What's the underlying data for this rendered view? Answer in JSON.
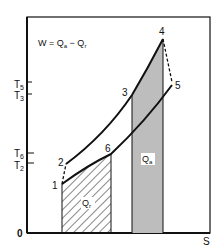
{
  "diagram": {
    "type": "T-S diagram (Brayton cycle with regeneration)",
    "equation": {
      "prefix": "W = Q",
      "sub_a": "a",
      "minus": " − Q",
      "sub_r": "r"
    },
    "axes": {
      "origin_label": "0",
      "x_label": "S",
      "y_ticks": [
        {
          "main": "T",
          "sub": "5"
        },
        {
          "main": "T",
          "sub": "3"
        },
        {
          "main": "T",
          "sub": "6"
        },
        {
          "main": "T",
          "sub": "2"
        }
      ]
    },
    "points": [
      {
        "label": "1"
      },
      {
        "label": "2"
      },
      {
        "label": "3"
      },
      {
        "label": "4"
      },
      {
        "label": "5"
      },
      {
        "label": "6"
      }
    ],
    "regions": {
      "heat_added": {
        "main": "Q",
        "sub": "a",
        "fill": "#bdbdbd"
      },
      "heat_rejected": {
        "main": "Q",
        "sub": "r",
        "pattern": "diagonal-hatch"
      }
    },
    "colors": {
      "line": "#111111",
      "shade": "#bdbdbd",
      "background": "#ffffff"
    }
  }
}
